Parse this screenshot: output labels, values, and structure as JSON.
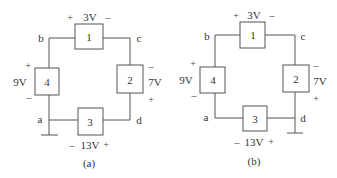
{
  "circuits": [
    {
      "caption": "(a)",
      "nodes": {
        "a": "a",
        "b": "b",
        "c": "c",
        "d": "d"
      },
      "elements": [
        {
          "id": "1",
          "voltage": "3V",
          "plus": "+",
          "minus": "–"
        },
        {
          "id": "2",
          "voltage": "7V",
          "plus": "+",
          "minus": "–"
        },
        {
          "id": "3",
          "voltage": "13V",
          "plus": "+",
          "minus": "–"
        },
        {
          "id": "4",
          "voltage": "9V",
          "plus": "+",
          "minus": "–"
        }
      ],
      "ground_node": "a"
    },
    {
      "caption": "(b)",
      "nodes": {
        "a": "a",
        "b": "b",
        "c": "c",
        "d": "d"
      },
      "elements": [
        {
          "id": "1",
          "voltage": "3V",
          "plus": "+",
          "minus": "–"
        },
        {
          "id": "2",
          "voltage": "7V",
          "plus": "+",
          "minus": "–"
        },
        {
          "id": "3",
          "voltage": "13V",
          "plus": "+",
          "minus": "–"
        },
        {
          "id": "4",
          "voltage": "9V",
          "plus": "+",
          "minus": "–"
        }
      ],
      "ground_node": "d"
    }
  ]
}
